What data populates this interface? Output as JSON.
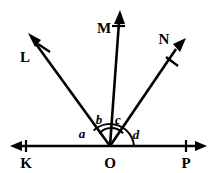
{
  "figure": {
    "type": "angle-diagram",
    "background_color": "#ffffff",
    "stroke_color": "#000000",
    "width": 217,
    "height": 173
  },
  "points": {
    "vertex": {
      "label": "O",
      "x": 110,
      "y": 146
    },
    "line_left": {
      "label": "K",
      "x": 24,
      "y": 146
    },
    "line_right": {
      "label": "P",
      "x": 196,
      "y": 146
    },
    "ray_l": {
      "label": "L",
      "x": 30,
      "y": 38
    },
    "ray_m": {
      "label": "M",
      "x": 117,
      "y": 16
    },
    "ray_n": {
      "label": "N",
      "x": 182,
      "y": 44
    }
  },
  "labels": {
    "K": "K",
    "O": "O",
    "P": "P",
    "L": "L",
    "M": "M",
    "N": "N"
  },
  "angles": [
    {
      "name": "a",
      "label": "a",
      "between": "K-O-L",
      "label_x": 82,
      "label_y": 138
    },
    {
      "name": "b",
      "label": "b",
      "between": "L-O-M",
      "label_x": 98,
      "label_y": 125
    },
    {
      "name": "c",
      "label": "c",
      "between": "M-O-N",
      "label_x": 117,
      "label_y": 125
    },
    {
      "name": "d",
      "label": "d",
      "between": "N-O-P",
      "label_x": 135,
      "label_y": 138
    }
  ],
  "arcs": [
    {
      "name": "outer-arc",
      "spans": "L-to-P",
      "radius": 22
    },
    {
      "name": "inner-arc",
      "spans": "L-to-N",
      "radius": 15
    }
  ],
  "arrowheads": [
    {
      "name": "arrow-k",
      "direction": "left"
    },
    {
      "name": "arrow-p",
      "direction": "right"
    },
    {
      "name": "arrow-l",
      "direction": "upper-left"
    },
    {
      "name": "arrow-m",
      "direction": "up"
    },
    {
      "name": "arrow-n",
      "direction": "upper-right"
    }
  ]
}
